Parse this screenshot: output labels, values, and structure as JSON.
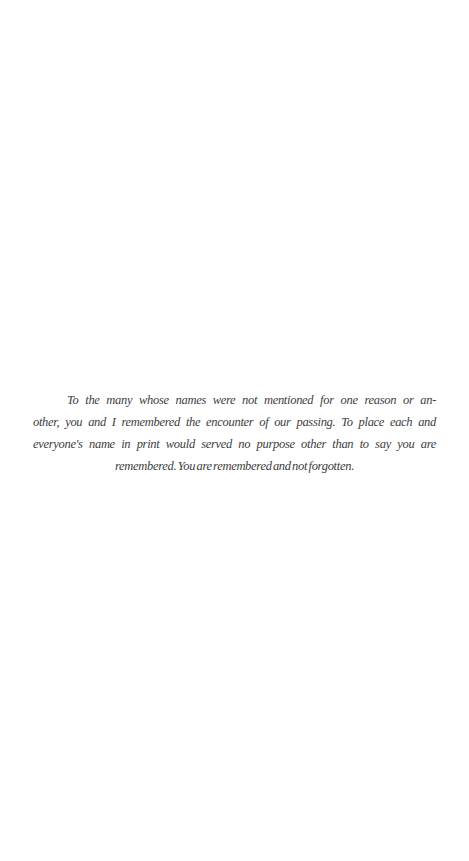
{
  "page": {
    "background_color": "#ffffff",
    "text_color": "#3d3d3d"
  },
  "dedication": {
    "lines": [
      "To the many whose names were not mentioned for one reason or an-",
      "other, you and I remembered the encounter of our passing. To place each and",
      "everyone's name in print would served no purpose other than to say you are",
      "remembered. You are remembered and not forgotten."
    ]
  }
}
